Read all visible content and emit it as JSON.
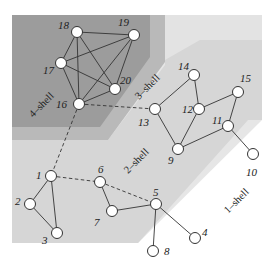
{
  "diagram": {
    "colors": {
      "shell_1": "#e6e6e6",
      "shell_2": "#d6d6d6",
      "shell_3": "#b9b9b9",
      "shell_4": "#9c9c9c",
      "node_fill": "#ffffff",
      "edge": "#333333"
    },
    "shells": [
      {
        "id": "1",
        "label": "1–shell"
      },
      {
        "id": "2",
        "label": "2–shell"
      },
      {
        "id": "3",
        "label": "3–shell"
      },
      {
        "id": "4",
        "label": "4–shell"
      }
    ],
    "nodes": [
      {
        "id": "1",
        "label": "1",
        "shell": 2
      },
      {
        "id": "2",
        "label": "2",
        "shell": 2
      },
      {
        "id": "3",
        "label": "3",
        "shell": 2
      },
      {
        "id": "4",
        "label": "4",
        "shell": 1
      },
      {
        "id": "5",
        "label": "5",
        "shell": 2
      },
      {
        "id": "6",
        "label": "6",
        "shell": 2
      },
      {
        "id": "7",
        "label": "7",
        "shell": 2
      },
      {
        "id": "8",
        "label": "8",
        "shell": 1
      },
      {
        "id": "9",
        "label": "9",
        "shell": 2
      },
      {
        "id": "10",
        "label": "10",
        "shell": 1
      },
      {
        "id": "11",
        "label": "11",
        "shell": 2
      },
      {
        "id": "12",
        "label": "12",
        "shell": 2
      },
      {
        "id": "13",
        "label": "13",
        "shell": 2
      },
      {
        "id": "14",
        "label": "14",
        "shell": 2
      },
      {
        "id": "15",
        "label": "15",
        "shell": 2
      },
      {
        "id": "16",
        "label": "16",
        "shell": 4
      },
      {
        "id": "17",
        "label": "17",
        "shell": 4
      },
      {
        "id": "18",
        "label": "18",
        "shell": 4
      },
      {
        "id": "19",
        "label": "19",
        "shell": 4
      },
      {
        "id": "20",
        "label": "20",
        "shell": 4
      }
    ],
    "edges": [
      [
        "16",
        "17"
      ],
      [
        "16",
        "18"
      ],
      [
        "16",
        "19"
      ],
      [
        "16",
        "20"
      ],
      [
        "17",
        "18"
      ],
      [
        "17",
        "19"
      ],
      [
        "17",
        "20"
      ],
      [
        "18",
        "19"
      ],
      [
        "18",
        "20"
      ],
      [
        "19",
        "20"
      ],
      [
        "1",
        "2"
      ],
      [
        "1",
        "3"
      ],
      [
        "2",
        "3"
      ],
      [
        "6",
        "7"
      ],
      [
        "7",
        "5"
      ],
      [
        "5",
        "4"
      ],
      [
        "5",
        "8"
      ],
      [
        "13",
        "14"
      ],
      [
        "14",
        "12"
      ],
      [
        "12",
        "15"
      ],
      [
        "15",
        "11"
      ],
      [
        "12",
        "9"
      ],
      [
        "13",
        "9"
      ],
      [
        "9",
        "11"
      ],
      [
        "11",
        "10"
      ]
    ],
    "dashed_edges": [
      [
        "16",
        "13"
      ],
      [
        "16",
        "1"
      ],
      [
        "1",
        "6"
      ],
      [
        "6",
        "5"
      ]
    ]
  }
}
